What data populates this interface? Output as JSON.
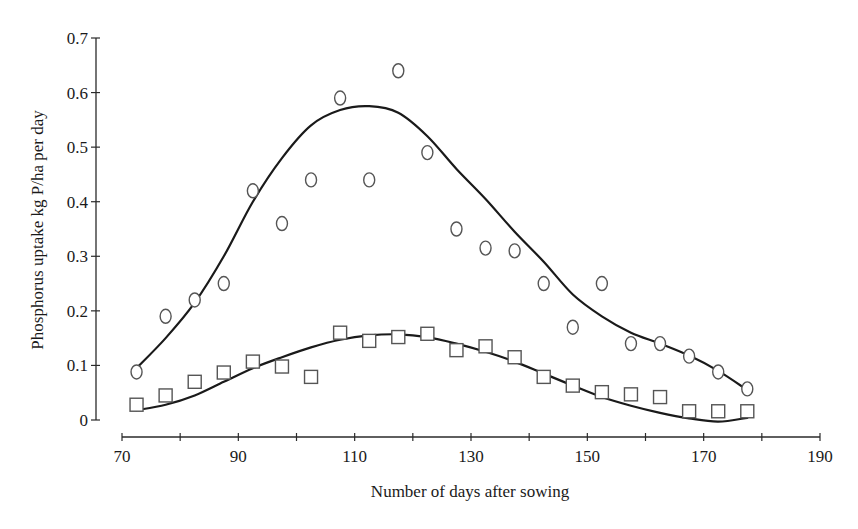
{
  "chart_data": {
    "type": "scatter",
    "title": "",
    "xlabel": "Number of days after sowing",
    "ylabel": "Phosphorus uptake kg P/ha per day",
    "xlim": [
      70,
      190
    ],
    "ylim": [
      0,
      0.7
    ],
    "x_ticks": [
      70,
      90,
      110,
      130,
      150,
      170,
      190
    ],
    "x_minor_ticks": [
      80,
      100,
      120,
      140,
      160,
      180
    ],
    "y_ticks": [
      0,
      0.1,
      0.2,
      0.3,
      0.4,
      0.5,
      0.6,
      0.7
    ],
    "x_tick_labels": [
      "70",
      "90",
      "110",
      "130",
      "150",
      "170",
      "190"
    ],
    "y_tick_labels": [
      "0",
      "0.1",
      "0.2",
      "0.3",
      "0.4",
      "0.5",
      "0.6",
      "0.7"
    ],
    "grid": false,
    "legend": null,
    "series": [
      {
        "name": "circles",
        "marker": "circle",
        "points": [
          [
            72.5,
            0.088
          ],
          [
            77.5,
            0.19
          ],
          [
            82.5,
            0.22
          ],
          [
            87.5,
            0.25
          ],
          [
            92.5,
            0.42
          ],
          [
            97.5,
            0.36
          ],
          [
            102.5,
            0.44
          ],
          [
            107.5,
            0.59
          ],
          [
            112.5,
            0.44
          ],
          [
            117.5,
            0.64
          ],
          [
            122.5,
            0.49
          ],
          [
            127.5,
            0.35
          ],
          [
            132.5,
            0.315
          ],
          [
            137.5,
            0.31
          ],
          [
            142.5,
            0.25
          ],
          [
            147.5,
            0.17
          ],
          [
            152.5,
            0.25
          ],
          [
            157.5,
            0.14
          ],
          [
            162.5,
            0.14
          ],
          [
            167.5,
            0.117
          ],
          [
            172.5,
            0.088
          ],
          [
            177.5,
            0.057
          ]
        ],
        "fitted_curve": [
          [
            72.5,
            0.095
          ],
          [
            77.5,
            0.15
          ],
          [
            82.5,
            0.215
          ],
          [
            87.5,
            0.3
          ],
          [
            92.5,
            0.4
          ],
          [
            97.5,
            0.48
          ],
          [
            102.5,
            0.54
          ],
          [
            107.5,
            0.568
          ],
          [
            112.5,
            0.575
          ],
          [
            117.5,
            0.563
          ],
          [
            122.5,
            0.52
          ],
          [
            127.5,
            0.46
          ],
          [
            132.5,
            0.405
          ],
          [
            137.5,
            0.345
          ],
          [
            142.5,
            0.29
          ],
          [
            147.5,
            0.23
          ],
          [
            152.5,
            0.19
          ],
          [
            157.5,
            0.16
          ],
          [
            162.5,
            0.14
          ],
          [
            167.5,
            0.118
          ],
          [
            172.5,
            0.09
          ],
          [
            177.5,
            0.055
          ]
        ]
      },
      {
        "name": "squares",
        "marker": "square",
        "points": [
          [
            72.5,
            0.028
          ],
          [
            77.5,
            0.045
          ],
          [
            82.5,
            0.07
          ],
          [
            87.5,
            0.087
          ],
          [
            92.5,
            0.107
          ],
          [
            97.5,
            0.098
          ],
          [
            102.5,
            0.079
          ],
          [
            107.5,
            0.16
          ],
          [
            112.5,
            0.145
          ],
          [
            117.5,
            0.152
          ],
          [
            122.5,
            0.158
          ],
          [
            127.5,
            0.128
          ],
          [
            132.5,
            0.135
          ],
          [
            137.5,
            0.115
          ],
          [
            142.5,
            0.079
          ],
          [
            147.5,
            0.063
          ],
          [
            152.5,
            0.051
          ],
          [
            157.5,
            0.047
          ],
          [
            162.5,
            0.042
          ],
          [
            167.5,
            0.016
          ],
          [
            172.5,
            0.016
          ],
          [
            177.5,
            0.016
          ]
        ],
        "fitted_curve": [
          [
            72.5,
            0.018
          ],
          [
            77.5,
            0.028
          ],
          [
            82.5,
            0.045
          ],
          [
            87.5,
            0.07
          ],
          [
            92.5,
            0.095
          ],
          [
            97.5,
            0.115
          ],
          [
            102.5,
            0.133
          ],
          [
            107.5,
            0.147
          ],
          [
            112.5,
            0.155
          ],
          [
            117.5,
            0.157
          ],
          [
            122.5,
            0.152
          ],
          [
            127.5,
            0.14
          ],
          [
            132.5,
            0.125
          ],
          [
            137.5,
            0.107
          ],
          [
            142.5,
            0.085
          ],
          [
            147.5,
            0.063
          ],
          [
            152.5,
            0.042
          ],
          [
            157.5,
            0.026
          ],
          [
            162.5,
            0.013
          ],
          [
            167.5,
            0.003
          ],
          [
            172.5,
            -0.003
          ],
          [
            177.5,
            0.004
          ]
        ]
      }
    ]
  }
}
